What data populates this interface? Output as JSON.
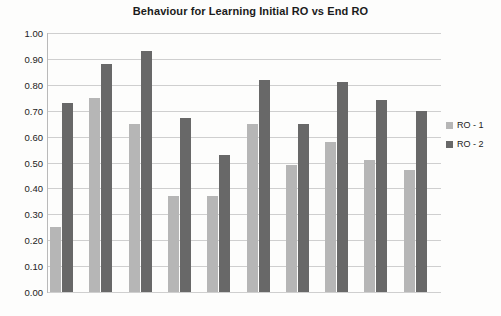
{
  "chart_data": {
    "type": "bar",
    "title": "Behaviour for Learning Initial RO vs End RO",
    "xlabel": "",
    "ylabel": "",
    "ylim": [
      0.0,
      1.0
    ],
    "ytick_step": 0.1,
    "ytick_labels": [
      "1.00",
      "0.90",
      "0.80",
      "0.70",
      "0.60",
      "0.50",
      "0.40",
      "0.30",
      "0.20",
      "0.10",
      "0.00"
    ],
    "grid": true,
    "legend_position": "right",
    "categories": [
      "1",
      "2",
      "3",
      "4",
      "5",
      "6",
      "7",
      "8",
      "9",
      "10"
    ],
    "series": [
      {
        "name": "RO - 1",
        "color": "#b6b6b6",
        "values": [
          0.25,
          0.75,
          0.65,
          0.37,
          0.37,
          0.65,
          0.49,
          0.58,
          0.51,
          0.47
        ]
      },
      {
        "name": "RO - 2",
        "color": "#686868",
        "values": [
          0.73,
          0.88,
          0.93,
          0.67,
          0.53,
          0.82,
          0.65,
          0.81,
          0.74,
          0.7
        ]
      }
    ]
  },
  "legend": {
    "items": [
      {
        "label": "RO - 1",
        "color": "#b6b6b6"
      },
      {
        "label": "RO - 2",
        "color": "#686868"
      }
    ]
  }
}
